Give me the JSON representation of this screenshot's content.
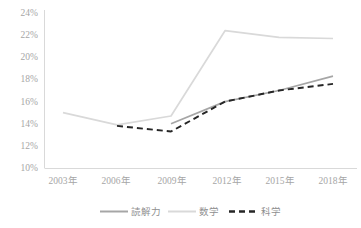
{
  "chart_data": {
    "type": "line",
    "title": "",
    "subtitle": "",
    "xlabel": "",
    "ylabel": "",
    "x": [
      "2003年",
      "2006年",
      "2009年",
      "2012年",
      "2015年",
      "2018年"
    ],
    "categories": [
      "2003年",
      "2006年",
      "2009年",
      "2012年",
      "2015年",
      "2018年"
    ],
    "series": [
      {
        "name": "読解力",
        "color": "#a6a6a6",
        "style": "solid",
        "values": [
          null,
          null,
          14.0,
          16.0,
          17.0,
          18.3
        ]
      },
      {
        "name": "数学",
        "color": "#d9d9d9",
        "style": "solid",
        "values": [
          15.0,
          13.9,
          14.7,
          22.4,
          21.8,
          21.7
        ]
      },
      {
        "name": "科学",
        "color": "#262626",
        "style": "dashed",
        "values": [
          null,
          13.8,
          13.3,
          16.0,
          17.0,
          17.6
        ]
      }
    ],
    "ylim": [
      10,
      24
    ],
    "ystep": 2,
    "yticks": [
      "10%",
      "12%",
      "14%",
      "16%",
      "18%",
      "20%",
      "22%",
      "24%"
    ],
    "ytick_values": [
      10,
      12,
      14,
      16,
      18,
      20,
      22,
      24
    ],
    "grid": false,
    "legend_position": "bottom",
    "legend": [
      "読解力",
      "数学",
      "科学"
    ],
    "axis_color": "#d9d9d9",
    "value_suffix": "%"
  },
  "legend_items": [
    {
      "label": "読解力",
      "color": "#a6a6a6",
      "style": "solid"
    },
    {
      "label": "数学",
      "color": "#d9d9d9",
      "style": "solid"
    },
    {
      "label": "科学",
      "color": "#262626",
      "style": "dashed"
    }
  ]
}
